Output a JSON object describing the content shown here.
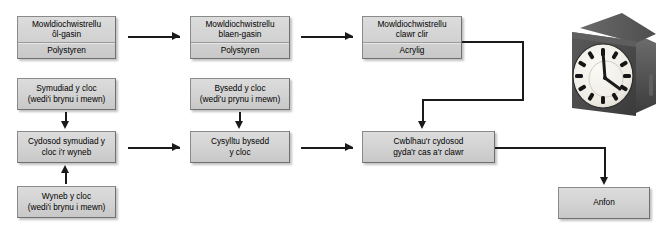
{
  "diagram": {
    "type": "flowchart",
    "colors": {
      "node_fill": "#d2d2d2",
      "node_border": "#8a8a8a",
      "connector": "#1a1a1a",
      "background": "#ffffff",
      "clock_body": "#474747",
      "clock_face": "#f2f0ea"
    },
    "nodes": [
      {
        "id": "mould-back-case",
        "process": "Mowldiochwistrellu",
        "detail": "ôl-gasin",
        "material": "Polystyren"
      },
      {
        "id": "mould-front-case",
        "process": "Mowldiochwistrellu",
        "detail": "blaen-gasin",
        "material": "Polystyren"
      },
      {
        "id": "mould-clear-cover",
        "process": "Mowldiochwistrellu",
        "detail": "clawr clir",
        "material": "Acrylig"
      },
      {
        "id": "clock-movement",
        "line1": "Symudiad y cloc",
        "line2": "(wedi'i brynu i mewn)"
      },
      {
        "id": "clock-hands",
        "line1": "Bysedd y cloc",
        "line2": "(wedi'u prynu i mewn)"
      },
      {
        "id": "assemble-movement-to-face",
        "line1": "Cydosod symudiad y",
        "line2": "cloc i'r wyneb"
      },
      {
        "id": "attach-hands",
        "line1": "Cysylltu bysedd",
        "line2": "y cloc"
      },
      {
        "id": "clock-face",
        "line1": "Wyneb y cloc",
        "line2": "(wedi'i brynu i mewn)"
      },
      {
        "id": "final-assembly",
        "line1": "Cwblhau'r cydosod",
        "line2": "gyda'r cas a'r clawr"
      },
      {
        "id": "dispatch",
        "line1": "Anfon"
      }
    ],
    "clock": {
      "label": "desk-clock-photo",
      "hour_marks": [
        "12",
        "1",
        "2",
        "3",
        "4",
        "5",
        "6",
        "7",
        "8",
        "9",
        "10",
        "11"
      ],
      "time_shown": "4:00"
    }
  }
}
